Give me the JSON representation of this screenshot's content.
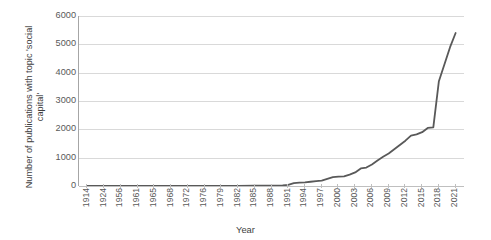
{
  "chart_data": {
    "type": "line",
    "title": "",
    "xlabel": "Year",
    "ylabel": "Number of publications with topic 'social capital'",
    "ylabel_line1": "Number of publications with topic 'social",
    "ylabel_line2": "capital'",
    "ylim": [
      0,
      6000
    ],
    "yticks": [
      6000,
      5000,
      4000,
      3000,
      2000,
      1000,
      0
    ],
    "ytick_labels": [
      "6000",
      "5000",
      "4000",
      "3000",
      "2000",
      "1000",
      "0"
    ],
    "grid": "horizontal",
    "legend": "none",
    "line_color": "#595959",
    "gridline_color": "#d9d9d9",
    "categories": [
      "1914",
      "1924",
      "1956",
      "1961",
      "1965",
      "1968",
      "1972",
      "1976",
      "1979",
      "1982",
      "1985",
      "1988",
      "1991",
      "1994",
      "1997",
      "2000",
      "2003",
      "2006",
      "2009",
      "2012",
      "2015",
      "2018",
      "2021"
    ],
    "xtick_labels": [
      "1914",
      "1924",
      "1956",
      "1961",
      "1965",
      "1968",
      "1972",
      "1976",
      "1979",
      "1982",
      "1985",
      "1988",
      "1991",
      "1994",
      "1997",
      "2000",
      "2003",
      "2006",
      "2009",
      "2012",
      "2015",
      "2018",
      "2021"
    ],
    "x": [
      1914,
      1924,
      1956,
      1961,
      1965,
      1968,
      1972,
      1976,
      1979,
      1982,
      1985,
      1988,
      1991,
      1994,
      1997,
      2000,
      2003,
      2006,
      2009,
      2012,
      2015,
      2018,
      2021
    ],
    "values": [
      1,
      1,
      2,
      2,
      3,
      3,
      4,
      5,
      6,
      7,
      9,
      15,
      40,
      130,
      190,
      330,
      480,
      760,
      1150,
      1600,
      1900,
      3700,
      5400
    ],
    "series": [
      {
        "name": "Publications with topic 'social capital'",
        "points": [
          {
            "year": 1914,
            "value": 1
          },
          {
            "year": 1924,
            "value": 1
          },
          {
            "year": 1956,
            "value": 2
          },
          {
            "year": 1961,
            "value": 2
          },
          {
            "year": 1965,
            "value": 3
          },
          {
            "year": 1968,
            "value": 3
          },
          {
            "year": 1972,
            "value": 4
          },
          {
            "year": 1976,
            "value": 5
          },
          {
            "year": 1979,
            "value": 6
          },
          {
            "year": 1982,
            "value": 7
          },
          {
            "year": 1985,
            "value": 9
          },
          {
            "year": 1988,
            "value": 15
          },
          {
            "year": 1990,
            "value": 25
          },
          {
            "year": 1991,
            "value": 40
          },
          {
            "year": 1992,
            "value": 100
          },
          {
            "year": 1993,
            "value": 120
          },
          {
            "year": 1994,
            "value": 130
          },
          {
            "year": 1995,
            "value": 150
          },
          {
            "year": 1996,
            "value": 170
          },
          {
            "year": 1997,
            "value": 190
          },
          {
            "year": 1998,
            "value": 250
          },
          {
            "year": 1999,
            "value": 310
          },
          {
            "year": 2000,
            "value": 330
          },
          {
            "year": 2001,
            "value": 340
          },
          {
            "year": 2002,
            "value": 400
          },
          {
            "year": 2003,
            "value": 480
          },
          {
            "year": 2004,
            "value": 620
          },
          {
            "year": 2005,
            "value": 650
          },
          {
            "year": 2006,
            "value": 760
          },
          {
            "year": 2007,
            "value": 900
          },
          {
            "year": 2008,
            "value": 1030
          },
          {
            "year": 2009,
            "value": 1150
          },
          {
            "year": 2010,
            "value": 1300
          },
          {
            "year": 2011,
            "value": 1450
          },
          {
            "year": 2012,
            "value": 1600
          },
          {
            "year": 2013,
            "value": 1780
          },
          {
            "year": 2014,
            "value": 1820
          },
          {
            "year": 2015,
            "value": 1900
          },
          {
            "year": 2016,
            "value": 2050
          },
          {
            "year": 2017,
            "value": 2070
          },
          {
            "year": 2018,
            "value": 3700
          },
          {
            "year": 2019,
            "value": 4300
          },
          {
            "year": 2020,
            "value": 4900
          },
          {
            "year": 2021,
            "value": 5400
          }
        ]
      }
    ]
  }
}
